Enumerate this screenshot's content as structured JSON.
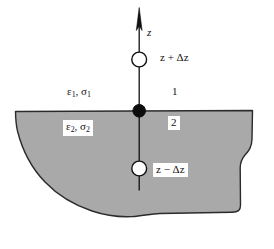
{
  "figure": {
    "background_color": "#ffffff",
    "ink_color": "#111111",
    "medium_fill_color": "#a9a9a9",
    "medium_edge_color": "#2b2b2b"
  },
  "axis": {
    "name": "z",
    "label": "z",
    "arrow_direction": "up"
  },
  "nodes": [
    {
      "id": "node-upper",
      "marker": "open-circle",
      "label": "z + Δz",
      "label_boxed": false,
      "medium": "1"
    },
    {
      "id": "node-interface",
      "marker": "filled-circle",
      "label": "",
      "label_boxed": false,
      "medium": "interface"
    },
    {
      "id": "node-lower",
      "marker": "open-circle",
      "label": "z − Δz",
      "label_boxed": true,
      "medium": "2"
    }
  ],
  "regions": [
    {
      "id": "region-1",
      "number": "1",
      "properties_label": "ε",
      "properties_sub": "1",
      "properties_label2": "σ",
      "properties_sub2": "1",
      "properties_text": "ε₁, σ₁",
      "boxed": false,
      "fill": "none",
      "description": "upper half-space"
    },
    {
      "id": "region-2",
      "number": "2",
      "properties_label": "ε",
      "properties_sub": "2",
      "properties_label2": "σ",
      "properties_sub2": "2",
      "properties_text": "ε₂, σ₂",
      "boxed": true,
      "fill": "#a9a9a9",
      "description": "lower shaded medium"
    }
  ],
  "labels": {
    "z_axis": "z",
    "z_plus_dz": "z + Δz",
    "z_minus_dz": "z − Δz",
    "region_1_number": "1",
    "region_2_number": "2",
    "eps1": "ε",
    "eps1_sub": "1",
    "sig1": "σ",
    "sig1_sub": "1",
    "eps2": "ε",
    "eps2_sub": "2",
    "sig2": "σ",
    "sig2_sub": "2",
    "comma": ", "
  }
}
